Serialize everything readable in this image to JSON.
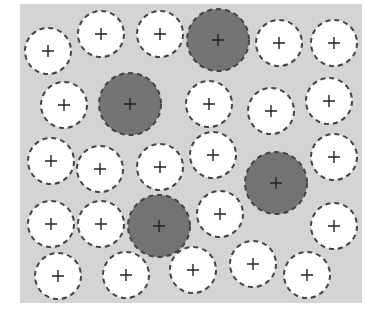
{
  "diagram": {
    "type": "circle-packing",
    "background": {
      "panel_color": "#d4d4d4",
      "page_color": "#ffffff",
      "panel_bounds": {
        "x": 20,
        "y": 4,
        "width": 342,
        "height": 299
      }
    },
    "styles": {
      "empty": {
        "fill": "#ffffff",
        "stroke": "#444444",
        "radius": 23
      },
      "filled": {
        "fill": "#737373",
        "stroke": "#444444",
        "radius": 31
      }
    },
    "marker": "plus",
    "circles": [
      {
        "x": 48,
        "y": 51,
        "kind": "empty"
      },
      {
        "x": 101,
        "y": 34,
        "kind": "empty"
      },
      {
        "x": 160,
        "y": 34,
        "kind": "empty"
      },
      {
        "x": 218,
        "y": 40,
        "kind": "filled"
      },
      {
        "x": 279,
        "y": 43,
        "kind": "empty"
      },
      {
        "x": 334,
        "y": 43,
        "kind": "empty"
      },
      {
        "x": 64,
        "y": 105,
        "kind": "empty"
      },
      {
        "x": 130,
        "y": 104,
        "kind": "filled"
      },
      {
        "x": 209,
        "y": 104,
        "kind": "empty"
      },
      {
        "x": 271,
        "y": 111,
        "kind": "empty"
      },
      {
        "x": 329,
        "y": 101,
        "kind": "empty"
      },
      {
        "x": 51,
        "y": 161,
        "kind": "empty"
      },
      {
        "x": 100,
        "y": 169,
        "kind": "empty"
      },
      {
        "x": 160,
        "y": 167,
        "kind": "empty"
      },
      {
        "x": 213,
        "y": 155,
        "kind": "empty"
      },
      {
        "x": 276,
        "y": 183,
        "kind": "filled"
      },
      {
        "x": 334,
        "y": 157,
        "kind": "empty"
      },
      {
        "x": 51,
        "y": 224,
        "kind": "empty"
      },
      {
        "x": 101,
        "y": 224,
        "kind": "empty"
      },
      {
        "x": 159,
        "y": 226,
        "kind": "filled"
      },
      {
        "x": 220,
        "y": 214,
        "kind": "empty"
      },
      {
        "x": 334,
        "y": 226,
        "kind": "empty"
      },
      {
        "x": 58,
        "y": 276,
        "kind": "empty"
      },
      {
        "x": 126,
        "y": 275,
        "kind": "empty"
      },
      {
        "x": 193,
        "y": 270,
        "kind": "empty"
      },
      {
        "x": 253,
        "y": 264,
        "kind": "empty"
      },
      {
        "x": 307,
        "y": 275,
        "kind": "empty"
      }
    ],
    "counts": {
      "empty": 23,
      "filled": 4,
      "total": 27
    }
  }
}
